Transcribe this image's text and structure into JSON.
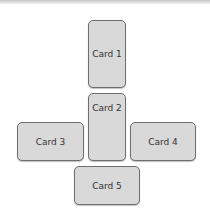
{
  "cards": [
    {
      "label": "Card 1"
    },
    {
      "label": "Card 2"
    },
    {
      "label": "Card 3"
    },
    {
      "label": "Card 4"
    },
    {
      "label": "Card 5"
    }
  ]
}
